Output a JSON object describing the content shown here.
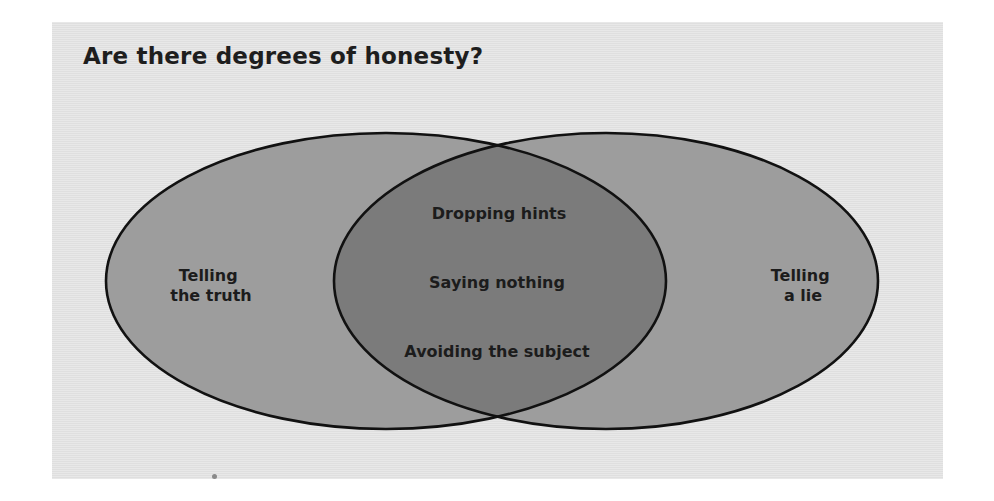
{
  "title": "Are there degrees of honesty?",
  "colors": {
    "panel_background": "#e3e3e3",
    "outer_fill": "#9d9d9d",
    "intersection_fill": "#7b7b7b",
    "outline": "#111111",
    "text": "#1c1c1c"
  },
  "diagram": {
    "type": "venn",
    "sets": [
      {
        "id": "left",
        "label_lines": [
          "Telling",
          "the truth"
        ]
      },
      {
        "id": "right",
        "label_lines": [
          "Telling",
          "a lie"
        ]
      }
    ],
    "intersection": {
      "items": [
        "Dropping hints",
        "Saying nothing",
        "Avoiding the subject"
      ]
    }
  }
}
